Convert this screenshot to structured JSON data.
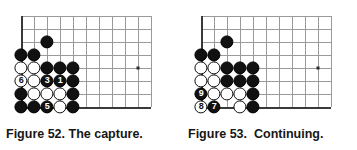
{
  "page": {
    "background": "#ffffff",
    "width": 357,
    "height": 150
  },
  "colors": {
    "black_stone": "#111111",
    "white_stone": "#ffffff",
    "grid_line": "#9a9a9a",
    "board_edge": "#3a3a3a",
    "star_point": "#2b2b2b",
    "caption_text": "#161616"
  },
  "figures": [
    {
      "id": "figure-52",
      "caption": "Figure 52. The capture.",
      "board": {
        "origin_x": 21,
        "origin_y": 16,
        "spacing": 13,
        "cols": 11,
        "rows": 8,
        "left_edge_col": 0,
        "bottom_edge_row": 7,
        "star_points": [
          {
            "col": 9,
            "row": 4
          }
        ],
        "stone_radius": 6.6
      },
      "stones": [
        {
          "col": 2,
          "row": 2,
          "color": "black",
          "label": ""
        },
        {
          "col": 0,
          "row": 3,
          "color": "black",
          "label": ""
        },
        {
          "col": 1,
          "row": 3,
          "color": "black",
          "label": ""
        },
        {
          "col": 0,
          "row": 4,
          "color": "white",
          "label": ""
        },
        {
          "col": 1,
          "row": 4,
          "color": "white",
          "label": ""
        },
        {
          "col": 2,
          "row": 4,
          "color": "black",
          "label": ""
        },
        {
          "col": 3,
          "row": 4,
          "color": "black",
          "label": ""
        },
        {
          "col": 4,
          "row": 4,
          "color": "black",
          "label": ""
        },
        {
          "col": 0,
          "row": 5,
          "color": "white",
          "label": "6"
        },
        {
          "col": 1,
          "row": 5,
          "color": "white",
          "label": ""
        },
        {
          "col": 2,
          "row": 5,
          "color": "black",
          "label": "3"
        },
        {
          "col": 3,
          "row": 5,
          "color": "black",
          "label": "1"
        },
        {
          "col": 4,
          "row": 5,
          "color": "black",
          "label": ""
        },
        {
          "col": 0,
          "row": 6,
          "color": "black",
          "label": ""
        },
        {
          "col": 1,
          "row": 6,
          "color": "white",
          "label": ""
        },
        {
          "col": 2,
          "row": 6,
          "color": "white",
          "label": ""
        },
        {
          "col": 3,
          "row": 6,
          "color": "white",
          "label": ""
        },
        {
          "col": 4,
          "row": 6,
          "color": "black",
          "label": ""
        },
        {
          "col": 0,
          "row": 7,
          "color": "black",
          "label": ""
        },
        {
          "col": 1,
          "row": 7,
          "color": "black",
          "label": ""
        },
        {
          "col": 2,
          "row": 7,
          "color": "black",
          "label": "5"
        },
        {
          "col": 3,
          "row": 7,
          "color": "white",
          "label": ""
        },
        {
          "col": 4,
          "row": 7,
          "color": "black",
          "label": ""
        }
      ]
    },
    {
      "id": "figure-53",
      "caption": "Figure 53.  Continuing.",
      "board": {
        "origin_x": 21,
        "origin_y": 16,
        "spacing": 13,
        "cols": 11,
        "rows": 8,
        "left_edge_col": 0,
        "bottom_edge_row": 7,
        "star_points": [
          {
            "col": 9,
            "row": 4
          }
        ],
        "stone_radius": 6.6
      },
      "stones": [
        {
          "col": 2,
          "row": 2,
          "color": "black",
          "label": ""
        },
        {
          "col": 0,
          "row": 3,
          "color": "black",
          "label": ""
        },
        {
          "col": 1,
          "row": 3,
          "color": "black",
          "label": ""
        },
        {
          "col": 0,
          "row": 4,
          "color": "white",
          "label": ""
        },
        {
          "col": 1,
          "row": 4,
          "color": "white",
          "label": ""
        },
        {
          "col": 2,
          "row": 4,
          "color": "black",
          "label": ""
        },
        {
          "col": 3,
          "row": 4,
          "color": "black",
          "label": ""
        },
        {
          "col": 4,
          "row": 4,
          "color": "black",
          "label": ""
        },
        {
          "col": 0,
          "row": 5,
          "color": "white",
          "label": ""
        },
        {
          "col": 1,
          "row": 5,
          "color": "white",
          "label": ""
        },
        {
          "col": 2,
          "row": 5,
          "color": "black",
          "label": ""
        },
        {
          "col": 3,
          "row": 5,
          "color": "black",
          "label": ""
        },
        {
          "col": 4,
          "row": 5,
          "color": "black",
          "label": ""
        },
        {
          "col": 0,
          "row": 6,
          "color": "black",
          "label": "9"
        },
        {
          "col": 1,
          "row": 6,
          "color": "white",
          "label": ""
        },
        {
          "col": 2,
          "row": 6,
          "color": "white",
          "label": ""
        },
        {
          "col": 3,
          "row": 6,
          "color": "white",
          "label": ""
        },
        {
          "col": 4,
          "row": 6,
          "color": "black",
          "label": ""
        },
        {
          "col": 0,
          "row": 7,
          "color": "white",
          "label": "8"
        },
        {
          "col": 1,
          "row": 7,
          "color": "black",
          "label": "7"
        },
        {
          "col": 3,
          "row": 7,
          "color": "white",
          "label": ""
        },
        {
          "col": 4,
          "row": 7,
          "color": "black",
          "label": ""
        }
      ]
    }
  ]
}
